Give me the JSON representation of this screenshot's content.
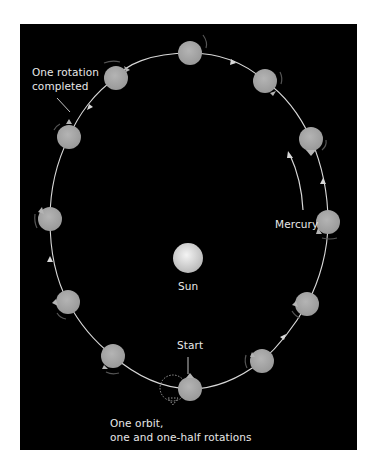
{
  "figure": {
    "type": "orbital-rotation-diagram",
    "colors": {
      "background": "#000000",
      "orbit": "#d8d8d8",
      "planet": "#a9a9a9",
      "sun": "#dcdcdc",
      "label": "#e8e8e8"
    }
  },
  "labels": {
    "rotation_line1": "One rotation",
    "rotation_line2": "completed",
    "mercury": "Mercury",
    "sun": "Sun",
    "start": "Start",
    "orbit_line1": "One orbit,",
    "orbit_line2": "one and one-half rotations"
  },
  "planets": [
    {
      "id": "top",
      "x": 190,
      "y": 53
    },
    {
      "id": "upper-left",
      "x": 116,
      "y": 78
    },
    {
      "id": "upper-right",
      "x": 265,
      "y": 81
    },
    {
      "id": "left-upper",
      "x": 69,
      "y": 137
    },
    {
      "id": "right-upper",
      "x": 311,
      "y": 139
    },
    {
      "id": "left-mid",
      "x": 50,
      "y": 219
    },
    {
      "id": "right-mid",
      "x": 328,
      "y": 222
    },
    {
      "id": "left-low",
      "x": 68,
      "y": 302
    },
    {
      "id": "right-low",
      "x": 307,
      "y": 304
    },
    {
      "id": "bottom-left",
      "x": 113,
      "y": 356
    },
    {
      "id": "bottom-right",
      "x": 262,
      "y": 361
    },
    {
      "id": "start",
      "x": 190,
      "y": 389
    }
  ],
  "sun": {
    "x": 188,
    "y": 258,
    "r": 15
  }
}
